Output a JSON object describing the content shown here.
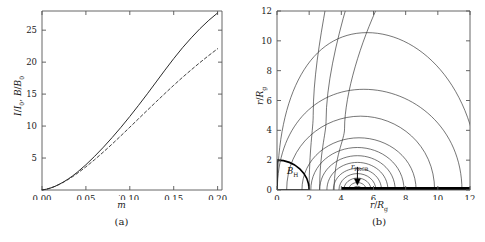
{
  "figure": {
    "background": "#ffffff",
    "line_color": "#2b2b2b",
    "axis_color": "#555555"
  },
  "panel_a": {
    "caption": "(a)",
    "xlabel_base": "m",
    "xlabel_dot": "˙",
    "ylabel_parts": {
      "i_sym": "I",
      "i_sub": "0",
      "b_sym": "B",
      "b_sub": "0",
      "sep": ", ",
      "slash": "/"
    },
    "xticks": [
      "0.00",
      "0.05",
      "0.10",
      "0.15",
      "0.20"
    ],
    "yticks": [
      "5",
      "10",
      "15",
      "20",
      "25"
    ]
  },
  "panel_b": {
    "caption": "(b)",
    "xlabel_parts": {
      "num": "r",
      "den_sym": "R",
      "den_sub": "g",
      "slash": "/"
    },
    "ylabel_parts": {
      "num": "r",
      "den_sym": "R",
      "den_sub": "g",
      "slash": "/"
    },
    "xticks": [
      "0",
      "2",
      "4",
      "6",
      "8",
      "10",
      "12"
    ],
    "yticks": [
      "0",
      "2",
      "4",
      "6",
      "8",
      "10",
      "12"
    ],
    "horizon_label": {
      "sym": "B",
      "sub": "H"
    },
    "marker_label": {
      "sym": "r",
      "sub": "PRCB"
    }
  },
  "chart_data": [
    {
      "type": "line",
      "panel": "a",
      "title": "",
      "xlabel": "mdot",
      "ylabel": "I/I_0, B/B_0",
      "xlim": [
        0.0,
        0.205
      ],
      "ylim": [
        0.0,
        28.0
      ],
      "xticks": [
        0.0,
        0.05,
        0.1,
        0.15,
        0.2
      ],
      "yticks": [
        5,
        10,
        15,
        20,
        25
      ],
      "grid": false,
      "legend": "none",
      "series": [
        {
          "name": "I/I_0",
          "style": "solid",
          "x": [
            0.0,
            0.005,
            0.01,
            0.015,
            0.02,
            0.025,
            0.03,
            0.035,
            0.04,
            0.05,
            0.06,
            0.07,
            0.08,
            0.09,
            0.1,
            0.11,
            0.12,
            0.13,
            0.14,
            0.15,
            0.16,
            0.17,
            0.18,
            0.19,
            0.2
          ],
          "y": [
            0.0,
            0.12,
            0.32,
            0.58,
            0.92,
            1.3,
            1.74,
            2.22,
            2.76,
            3.95,
            5.28,
            6.7,
            8.22,
            9.82,
            11.5,
            13.25,
            15.05,
            16.9,
            18.75,
            20.55,
            22.25,
            23.8,
            25.25,
            26.55,
            27.7
          ]
        },
        {
          "name": "B/B_0",
          "style": "dashed",
          "x": [
            0.0,
            0.005,
            0.01,
            0.015,
            0.02,
            0.025,
            0.03,
            0.035,
            0.04,
            0.05,
            0.06,
            0.07,
            0.08,
            0.09,
            0.1,
            0.11,
            0.12,
            0.13,
            0.14,
            0.15,
            0.16,
            0.17,
            0.18,
            0.19,
            0.2
          ],
          "y": [
            0.0,
            0.12,
            0.32,
            0.58,
            0.9,
            1.26,
            1.66,
            2.1,
            2.58,
            3.62,
            4.75,
            5.95,
            7.2,
            8.5,
            9.82,
            11.15,
            12.48,
            13.8,
            15.1,
            16.38,
            17.62,
            18.8,
            19.95,
            21.05,
            22.1
          ]
        }
      ]
    },
    {
      "type": "contour",
      "panel": "b",
      "title": "",
      "xlabel": "r/R_g",
      "ylabel": "r/R_g",
      "xlim": [
        0,
        12
      ],
      "ylim": [
        0,
        12
      ],
      "xticks": [
        0,
        2,
        4,
        6,
        8,
        10,
        12
      ],
      "yticks": [
        0,
        2,
        4,
        6,
        8,
        10,
        12
      ],
      "grid": false,
      "legend": "none",
      "annotations": [
        {
          "text": "B_H",
          "x": 0.9,
          "y": 0.75,
          "note": "black-hole horizon region"
        },
        {
          "text": "r_PRCB",
          "x": 5.0,
          "y": 0.95,
          "note": "arrow marker on equatorial bar"
        }
      ],
      "horizon_arc": {
        "center": [
          0,
          0
        ],
        "radius": 2.0
      },
      "equatorial_bar": {
        "x_start": 4.0,
        "x_end": 12.0,
        "y": 0.0
      },
      "contours": [
        {
          "level": 1,
          "closed_loop": true,
          "apex_x": 5.0,
          "apex_y": 0.25,
          "half_width": 0.3
        },
        {
          "level": 2,
          "closed_loop": true,
          "apex_x": 5.0,
          "apex_y": 0.5,
          "half_width": 0.55
        },
        {
          "level": 3,
          "closed_loop": true,
          "apex_x": 5.0,
          "apex_y": 0.8,
          "half_width": 0.85
        },
        {
          "level": 4,
          "closed_loop": true,
          "apex_x": 5.0,
          "apex_y": 1.1,
          "half_width": 1.15
        },
        {
          "level": 5,
          "closed_loop": true,
          "apex_x": 5.0,
          "apex_y": 1.45,
          "half_width": 1.5
        },
        {
          "level": 6,
          "closed_loop": true,
          "apex_x": 5.0,
          "apex_y": 1.85,
          "half_width": 1.9
        },
        {
          "level": 7,
          "closed_loop": true,
          "apex_x": 5.0,
          "apex_y": 2.3,
          "half_width": 2.35
        },
        {
          "level": 8,
          "closed_loop": true,
          "apex_x": 5.0,
          "apex_y": 2.85,
          "half_width": 2.9
        },
        {
          "level": 9,
          "closed_loop": true,
          "apex_x": 5.1,
          "apex_y": 3.5,
          "half_width": 3.55
        },
        {
          "level": 10,
          "closed_loop": true,
          "apex_x": 5.2,
          "apex_y": 4.95,
          "half_width": 4.6
        },
        {
          "level": 11,
          "closed_loop": true,
          "apex_x": 5.4,
          "apex_y": 6.75,
          "half_width": 6.1
        },
        {
          "level": 12,
          "closed_loop": true,
          "apex_x": 5.6,
          "apex_y": 10.55,
          "half_width": 7.0
        },
        {
          "level": 13,
          "open_curve": true,
          "note": "rises off top edge near x=3.5"
        },
        {
          "level": 14,
          "open_curve": true,
          "note": "rises off top edge near x=2.6"
        },
        {
          "level": 15,
          "open_curve": true,
          "note": "rises off top edge near x=2.0"
        }
      ]
    }
  ]
}
